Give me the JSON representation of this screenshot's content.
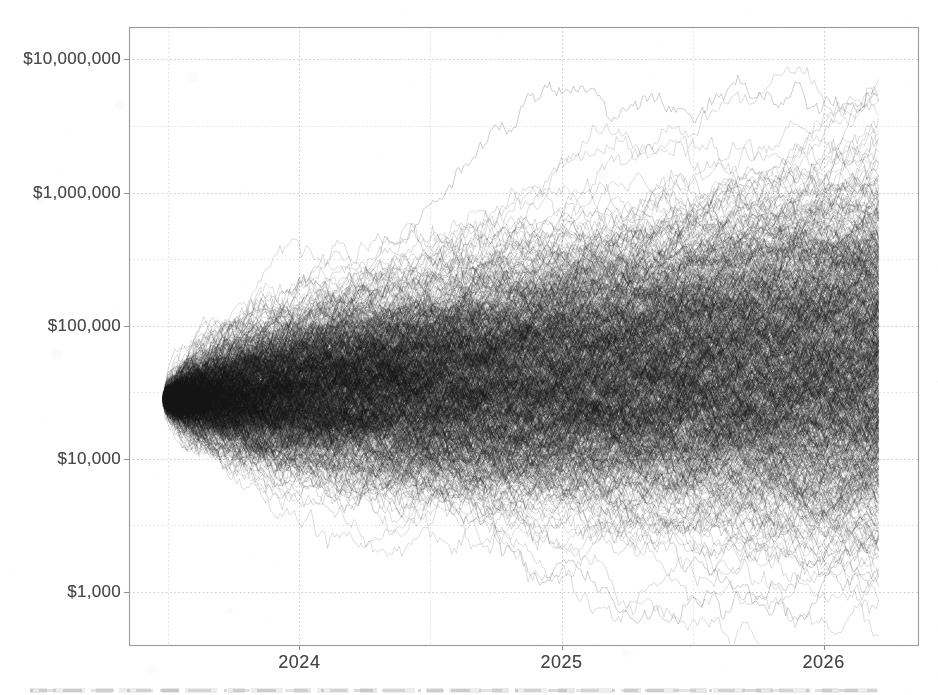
{
  "chart_data": {
    "type": "line",
    "subtype": "monte-carlo-simulation-fan",
    "title": "",
    "xlabel": "",
    "ylabel": "",
    "grid": "dotted",
    "legend": "none",
    "x_axis": {
      "scale": "linear-time",
      "range_years": [
        2023.35,
        2026.36
      ],
      "ticks": [
        {
          "label": "2024",
          "year": 2024
        },
        {
          "label": "2025",
          "year": 2025
        },
        {
          "label": "2026",
          "year": 2026
        }
      ],
      "minor_gridline_years": [
        2023.5,
        2024.5,
        2025.5
      ]
    },
    "y_axis": {
      "scale": "log10",
      "unit": "US dollars",
      "range_dollars": [
        400,
        17500000
      ],
      "ticks": [
        {
          "label": "$10,000,000",
          "value": 10000000
        },
        {
          "label": "$1,000,000",
          "value": 1000000
        },
        {
          "label": "$100,000",
          "value": 100000
        },
        {
          "label": "$10,000",
          "value": 10000
        },
        {
          "label": "$1,000",
          "value": 1000
        }
      ],
      "minor_gridline_values": [
        3162,
        31623,
        316228,
        3162278
      ]
    },
    "simulation": {
      "n_paths": 800,
      "highlight_paths": 60,
      "steps": 300,
      "start_year": 2023.48,
      "end_year": 2026.21,
      "start_value_dollars": 28000,
      "start_jitter_ln": 0.045,
      "annual_drift_ln": 0.25,
      "annual_volatility_ln": 0.95,
      "median_end_value_dollars": 55000,
      "end_value_range_dollars": [
        700,
        6000000
      ],
      "path_alpha": 0.2,
      "highlight_alpha": 0.3,
      "seed": 1234567
    },
    "colors": {
      "background": "#ffffff",
      "path_color": "#1a1a1a",
      "plot_border": "#9a9a9a",
      "major_grid": "#c6c6c6",
      "minor_grid": "#dedede",
      "axis_tick": "#8f8f8f",
      "axis_text": "#4a4a4a"
    }
  }
}
